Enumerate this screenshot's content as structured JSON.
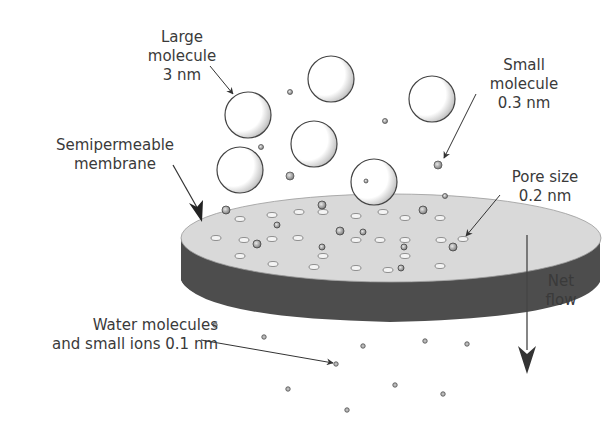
{
  "diagram": {
    "type": "semipermeable-membrane-filtration",
    "labels": {
      "large_molecule": [
        "Large",
        "molecule",
        "3 nm"
      ],
      "small_molecule": [
        "Small",
        "molecule",
        "0.3 nm"
      ],
      "membrane": [
        "Semipermeable",
        "membrane"
      ],
      "pore_size": [
        "Pore size",
        "0.2 nm"
      ],
      "water": [
        "Water molecules",
        "and small ions 0.1 nm"
      ],
      "net_flow": [
        "Net",
        "flow"
      ]
    },
    "colors": {
      "text": "#3a3a3a",
      "outline": "#444444",
      "membrane_top": "#d8d8d8",
      "membrane_side": "#4a4a4a",
      "arrow": "#333333"
    },
    "large_molecules": [
      {
        "cx": 248,
        "cy": 115,
        "r": 23
      },
      {
        "cx": 331,
        "cy": 79,
        "r": 23
      },
      {
        "cx": 432,
        "cy": 99,
        "r": 23
      },
      {
        "cx": 240,
        "cy": 170,
        "r": 23
      },
      {
        "cx": 314,
        "cy": 144,
        "r": 23
      },
      {
        "cx": 374,
        "cy": 182,
        "r": 23
      }
    ],
    "small_molecules": [
      {
        "cx": 290,
        "cy": 92
      },
      {
        "cx": 261,
        "cy": 147
      },
      {
        "cx": 385,
        "cy": 121
      },
      {
        "cx": 290,
        "cy": 176
      },
      {
        "cx": 366,
        "cy": 181
      },
      {
        "cx": 438,
        "cy": 165
      },
      {
        "cx": 445,
        "cy": 196
      }
    ],
    "water_molecules": [
      {
        "cx": 215,
        "cy": 325
      },
      {
        "cx": 264,
        "cy": 337
      },
      {
        "cx": 363,
        "cy": 346
      },
      {
        "cx": 425,
        "cy": 341
      },
      {
        "cx": 467,
        "cy": 344
      },
      {
        "cx": 336,
        "cy": 364
      },
      {
        "cx": 288,
        "cy": 389
      },
      {
        "cx": 395,
        "cy": 385
      },
      {
        "cx": 443,
        "cy": 394
      },
      {
        "cx": 347,
        "cy": 410
      }
    ]
  }
}
